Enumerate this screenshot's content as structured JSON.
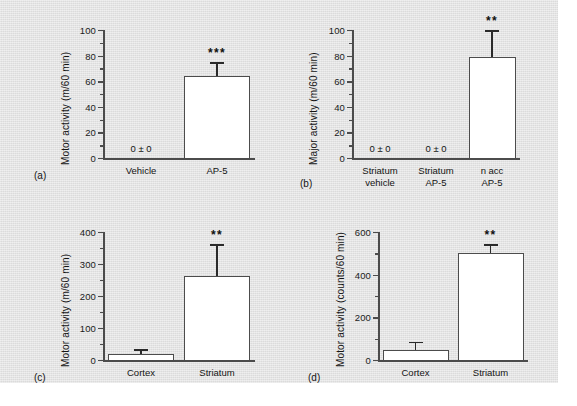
{
  "figure": {
    "background_color": "#e3e3e3",
    "bar_fill_color": "#ffffff",
    "line_color": "#4c4c4c"
  },
  "panels": [
    {
      "letter": "(a)",
      "ylabel": "Motor activity (m/60 min)",
      "chart_data": {
        "type": "bar",
        "title": "",
        "xlabel": "",
        "ylabel": "Motor activity (m/60 min)",
        "ylim": [
          0,
          100
        ],
        "yticks": [
          0,
          20,
          40,
          60,
          80,
          100
        ],
        "yminor": [
          10,
          30,
          50,
          70,
          90
        ],
        "grid": false,
        "legend": "none",
        "categories": [
          "Vehicle",
          "AP-5"
        ],
        "values": [
          0,
          64
        ],
        "errors": [
          0,
          11
        ],
        "annotations": [
          "0 ± 0",
          "***"
        ],
        "significance": [
          null,
          "***"
        ],
        "value_labels": [
          "0 ± 0",
          ""
        ]
      }
    },
    {
      "letter": "(b)",
      "ylabel": "Major activity (m/60 min)",
      "chart_data": {
        "type": "bar",
        "title": "",
        "xlabel": "",
        "ylabel": "Major activity (m/60 min)",
        "ylim": [
          0,
          100
        ],
        "yticks": [
          0,
          20,
          40,
          60,
          80,
          100
        ],
        "yminor": [
          10,
          30,
          50,
          70,
          90
        ],
        "grid": false,
        "legend": "none",
        "categories": [
          "Striatum vehicle",
          "Striatum AP-5",
          "n acc AP-5"
        ],
        "category_lines": [
          [
            "Striatum",
            "vehicle"
          ],
          [
            "Striatum",
            "AP-5"
          ],
          [
            "n acc",
            "AP-5"
          ]
        ],
        "values": [
          0,
          0,
          79
        ],
        "errors": [
          0,
          0,
          21
        ],
        "annotations": [
          "0 ± 0",
          "0 ± 0",
          "**"
        ],
        "significance": [
          null,
          null,
          "**"
        ],
        "value_labels": [
          "0 ± 0",
          "0 ± 0",
          ""
        ]
      }
    },
    {
      "letter": "(c)",
      "ylabel": "Motor activity (m/60 min)",
      "chart_data": {
        "type": "bar",
        "title": "",
        "xlabel": "",
        "ylabel": "Motor activity (m/60 min)",
        "ylim": [
          0,
          400
        ],
        "yticks": [
          0,
          100,
          200,
          300,
          400
        ],
        "yminor": [
          50,
          150,
          250,
          350
        ],
        "grid": false,
        "legend": "none",
        "categories": [
          "Cortex",
          "Striatum"
        ],
        "values": [
          20,
          262
        ],
        "errors": [
          14,
          100
        ],
        "annotations": [
          "**"
        ],
        "significance": [
          null,
          "**"
        ],
        "value_labels": [
          "",
          ""
        ]
      }
    },
    {
      "letter": "(d)",
      "ylabel": "Motor activity (counts/60 min)",
      "chart_data": {
        "type": "bar",
        "title": "",
        "xlabel": "",
        "ylabel": "Motor activity (counts/60 min)",
        "ylim": [
          0,
          600
        ],
        "yticks": [
          0,
          200,
          400,
          600
        ],
        "yminor": [
          100,
          300,
          500
        ],
        "grid": false,
        "legend": "none",
        "categories": [
          "Cortex",
          "Striatum"
        ],
        "values": [
          48,
          503
        ],
        "errors": [
          38,
          40
        ],
        "annotations": [
          "**"
        ],
        "significance": [
          null,
          "**"
        ],
        "value_labels": [
          "",
          ""
        ]
      }
    }
  ]
}
